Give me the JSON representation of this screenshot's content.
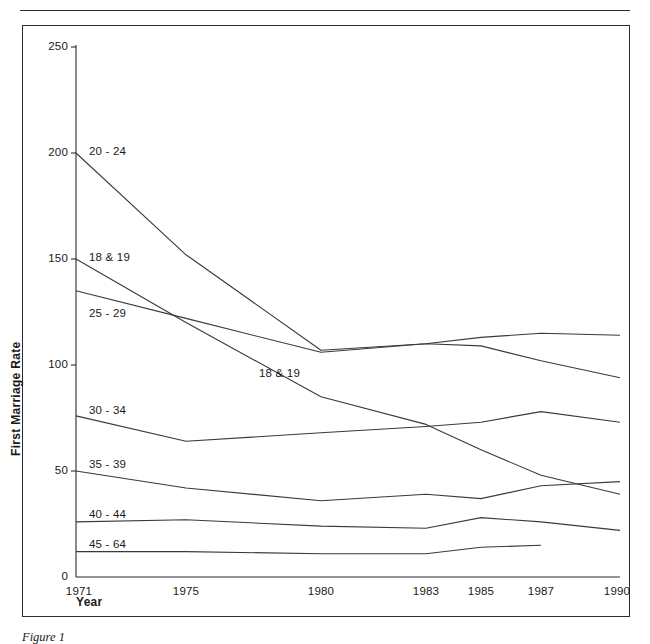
{
  "figure": {
    "caption": "Figure 1"
  },
  "chart_data": {
    "type": "line",
    "title": "",
    "xlabel": "Year",
    "ylabel": "First Marriage Rate",
    "grid": false,
    "legend_position": "inline-labels",
    "x": [
      1971,
      1975,
      1980,
      1983,
      1985,
      1987,
      1990
    ],
    "xtick_labels": [
      "1971",
      "1975",
      "1980",
      "1983",
      "1985",
      "1987",
      "1990"
    ],
    "ytick_labels": [
      "0",
      "50",
      "100",
      "150",
      "200",
      "250"
    ],
    "yticks": [
      0,
      50,
      100,
      150,
      200,
      250
    ],
    "xlim": [
      1971,
      1990
    ],
    "ylim": [
      0,
      250
    ],
    "series": [
      {
        "name": "20 - 24",
        "label": "20 - 24",
        "values": [
          200,
          152,
          107,
          110,
          113,
          115,
          114
        ]
      },
      {
        "name": "18 & 19",
        "label": "18 & 19",
        "second_label": "18 & 19",
        "values": [
          150,
          120,
          85,
          72,
          60,
          48,
          39
        ]
      },
      {
        "name": "25 - 29",
        "label": "25 - 29",
        "values": [
          135,
          122,
          106,
          110,
          109,
          102,
          94
        ]
      },
      {
        "name": "30 - 34",
        "label": "30 - 34",
        "values": [
          76,
          64,
          68,
          71,
          73,
          78,
          73
        ]
      },
      {
        "name": "35 - 39",
        "label": "35 - 39",
        "values": [
          50,
          42,
          36,
          39,
          37,
          43,
          45
        ]
      },
      {
        "name": "40 - 44",
        "label": "40 - 44",
        "values": [
          26,
          27,
          24,
          23,
          28,
          26,
          22
        ]
      },
      {
        "name": "45 - 64",
        "label": "45 - 64",
        "values": [
          12,
          12,
          11,
          11,
          14,
          15,
          null
        ]
      }
    ],
    "series_labels_inline": [
      {
        "text": "20 - 24",
        "x": 88,
        "y": 152
      },
      {
        "text": "18 & 19",
        "x": 88,
        "y": 258
      },
      {
        "text": "25 - 29",
        "x": 88,
        "y": 314
      },
      {
        "text": "18 & 19",
        "x": 258,
        "y": 374
      },
      {
        "text": "30 - 34",
        "x": 88,
        "y": 411
      },
      {
        "text": "35 - 39",
        "x": 88,
        "y": 465
      },
      {
        "text": "40 - 44",
        "x": 88,
        "y": 515
      },
      {
        "text": "45 - 64",
        "x": 88,
        "y": 545
      }
    ],
    "axis_color": "#2b2b2b",
    "line_color": "#3a3a3a"
  }
}
